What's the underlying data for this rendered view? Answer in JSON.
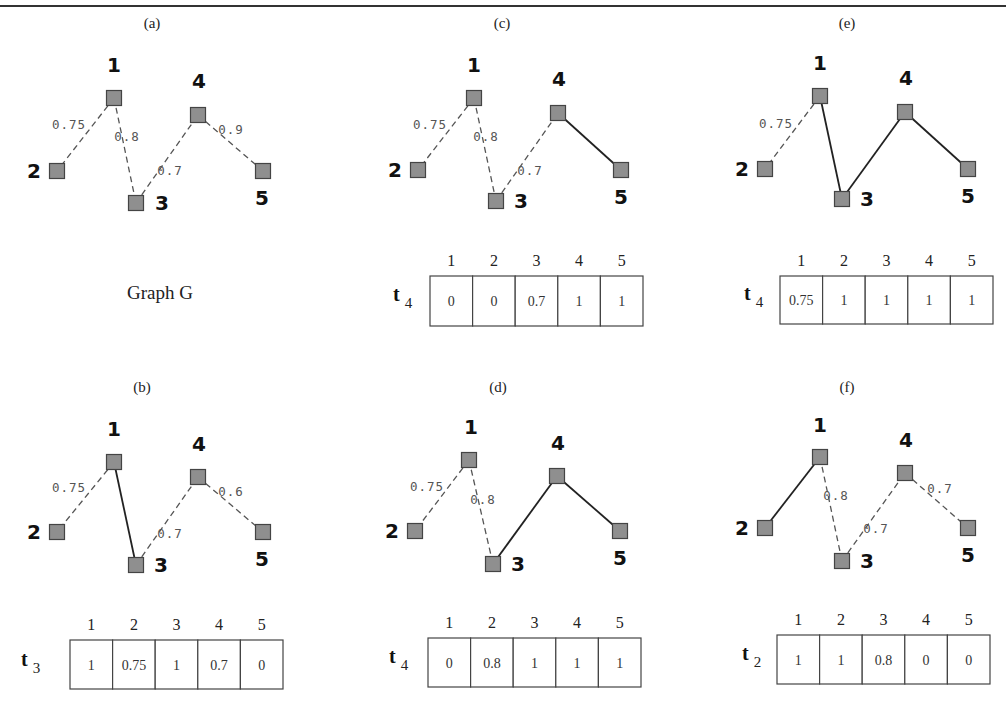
{
  "figure": {
    "colors": {
      "node_fill": "#8f8f8f",
      "node_stroke": "#444444",
      "solid_edge": "#222222",
      "dashed_edge": "#555555",
      "weight_text": "#555555",
      "table_border": "#444444"
    },
    "graph_caption": {
      "text": "Graph G",
      "x": 160,
      "y": 299
    },
    "panels": [
      {
        "id": "a",
        "caption": "(a)",
        "caption_pos": [
          152,
          28
        ],
        "nodes": [
          {
            "id": "1",
            "x": 114,
            "y": 98,
            "label_pos": [
              114,
              72
            ]
          },
          {
            "id": "2",
            "x": 57,
            "y": 171,
            "label_pos": [
              34,
              178
            ]
          },
          {
            "id": "3",
            "x": 136,
            "y": 203,
            "label_pos": [
              162,
              210
            ]
          },
          {
            "id": "4",
            "x": 198,
            "y": 115,
            "label_pos": [
              199,
              88
            ]
          },
          {
            "id": "5",
            "x": 263,
            "y": 171,
            "label_pos": [
              262,
              205
            ]
          }
        ],
        "edges": [
          {
            "from": "1",
            "to": "2",
            "style": "dashed",
            "weight": "0.75",
            "weight_pos": [
              69,
              129
            ]
          },
          {
            "from": "1",
            "to": "3",
            "style": "dashed",
            "weight": "0.8",
            "weight_pos": [
              127,
              141
            ]
          },
          {
            "from": "3",
            "to": "4",
            "style": "dashed",
            "weight": "0.7",
            "weight_pos": [
              170,
              175
            ]
          },
          {
            "from": "4",
            "to": "5",
            "style": "dashed",
            "weight": "0.9",
            "weight_pos": [
              231,
              134
            ]
          }
        ],
        "table": null
      },
      {
        "id": "c",
        "caption": "(c)",
        "caption_pos": [
          502,
          28
        ],
        "nodes": [
          {
            "id": "1",
            "x": 474,
            "y": 98,
            "label_pos": [
              474,
              72
            ]
          },
          {
            "id": "2",
            "x": 418,
            "y": 170,
            "label_pos": [
              395,
              177
            ]
          },
          {
            "id": "3",
            "x": 496,
            "y": 201,
            "label_pos": [
              521,
              208
            ]
          },
          {
            "id": "4",
            "x": 558,
            "y": 113,
            "label_pos": [
              559,
              86
            ]
          },
          {
            "id": "5",
            "x": 621,
            "y": 170,
            "label_pos": [
              621,
              204
            ]
          }
        ],
        "edges": [
          {
            "from": "1",
            "to": "2",
            "style": "dashed",
            "weight": "0.75",
            "weight_pos": [
              430,
              129
            ]
          },
          {
            "from": "1",
            "to": "3",
            "style": "dashed",
            "weight": "0.8",
            "weight_pos": [
              486,
              141
            ]
          },
          {
            "from": "3",
            "to": "4",
            "style": "dashed",
            "weight": "0.7",
            "weight_pos": [
              530,
              175
            ]
          },
          {
            "from": "4",
            "to": "5",
            "style": "solid",
            "weight": "",
            "weight_pos": null
          }
        ],
        "table": {
          "x": 430,
          "y": 276,
          "cell_w": 42.6,
          "cell_h": 50,
          "row_label": "t",
          "row_sub": "4",
          "row_label_pos": [
            393,
            301
          ],
          "headers": [
            "1",
            "2",
            "3",
            "4",
            "5"
          ],
          "values": [
            "0",
            "0",
            "0.7",
            "1",
            "1"
          ]
        }
      },
      {
        "id": "e",
        "caption": "(e)",
        "caption_pos": [
          847,
          28
        ],
        "nodes": [
          {
            "id": "1",
            "x": 820,
            "y": 96,
            "label_pos": [
              820,
              70
            ]
          },
          {
            "id": "2",
            "x": 765,
            "y": 169,
            "label_pos": [
              742,
              176
            ]
          },
          {
            "id": "3",
            "x": 842,
            "y": 199,
            "label_pos": [
              867,
              206
            ]
          },
          {
            "id": "4",
            "x": 905,
            "y": 112,
            "label_pos": [
              906,
              85
            ]
          },
          {
            "id": "5",
            "x": 968,
            "y": 169,
            "label_pos": [
              968,
              203
            ]
          }
        ],
        "edges": [
          {
            "from": "1",
            "to": "2",
            "style": "dashed",
            "weight": "0.75",
            "weight_pos": [
              776,
              128
            ]
          },
          {
            "from": "1",
            "to": "3",
            "style": "solid",
            "weight": "",
            "weight_pos": null
          },
          {
            "from": "3",
            "to": "4",
            "style": "solid",
            "weight": "",
            "weight_pos": null
          },
          {
            "from": "4",
            "to": "5",
            "style": "solid",
            "weight": "",
            "weight_pos": null
          }
        ],
        "table": {
          "x": 780,
          "y": 276,
          "cell_w": 42.6,
          "cell_h": 48,
          "row_label": "t",
          "row_sub": "4",
          "row_label_pos": [
            744,
            300
          ],
          "headers": [
            "1",
            "2",
            "3",
            "4",
            "5"
          ],
          "values": [
            "0.75",
            "1",
            "1",
            "1",
            "1"
          ]
        }
      },
      {
        "id": "b",
        "caption": "(b)",
        "caption_pos": [
          142,
          392
        ],
        "nodes": [
          {
            "id": "1",
            "x": 114,
            "y": 462,
            "label_pos": [
              114,
              436
            ]
          },
          {
            "id": "2",
            "x": 57,
            "y": 532,
            "label_pos": [
              34,
              539
            ]
          },
          {
            "id": "3",
            "x": 136,
            "y": 565,
            "label_pos": [
              161,
              572
            ]
          },
          {
            "id": "4",
            "x": 198,
            "y": 477,
            "label_pos": [
              199,
              451
            ]
          },
          {
            "id": "5",
            "x": 263,
            "y": 532,
            "label_pos": [
              262,
              566
            ]
          }
        ],
        "edges": [
          {
            "from": "1",
            "to": "2",
            "style": "dashed",
            "weight": "0.75",
            "weight_pos": [
              69,
              492
            ]
          },
          {
            "from": "1",
            "to": "3",
            "style": "solid",
            "weight": "",
            "weight_pos": null
          },
          {
            "from": "3",
            "to": "4",
            "style": "dashed",
            "weight": "0.7",
            "weight_pos": [
              170,
              538
            ]
          },
          {
            "from": "4",
            "to": "5",
            "style": "dashed",
            "weight": "0.6",
            "weight_pos": [
              231,
              496
            ]
          }
        ],
        "table": {
          "x": 70,
          "y": 640,
          "cell_w": 42.6,
          "cell_h": 49,
          "row_label": "t",
          "row_sub": "3",
          "row_label_pos": [
            21,
            666
          ],
          "headers": [
            "1",
            "2",
            "3",
            "4",
            "5"
          ],
          "values": [
            "1",
            "0.75",
            "1",
            "0.7",
            "0"
          ]
        }
      },
      {
        "id": "d",
        "caption": "(d)",
        "caption_pos": [
          498,
          392
        ],
        "nodes": [
          {
            "id": "1",
            "x": 469,
            "y": 460,
            "label_pos": [
              471,
              434
            ]
          },
          {
            "id": "2",
            "x": 415,
            "y": 531,
            "label_pos": [
              392,
              538
            ]
          },
          {
            "id": "3",
            "x": 493,
            "y": 564,
            "label_pos": [
              518,
              571
            ]
          },
          {
            "id": "4",
            "x": 557,
            "y": 476,
            "label_pos": [
              558,
              450
            ]
          },
          {
            "id": "5",
            "x": 620,
            "y": 531,
            "label_pos": [
              620,
              565
            ]
          }
        ],
        "edges": [
          {
            "from": "1",
            "to": "2",
            "style": "dashed",
            "weight": "0.75",
            "weight_pos": [
              427,
              491
            ]
          },
          {
            "from": "1",
            "to": "3",
            "style": "dashed",
            "weight": "0.8",
            "weight_pos": [
              483,
              504
            ]
          },
          {
            "from": "3",
            "to": "4",
            "style": "solid",
            "weight": "",
            "weight_pos": null
          },
          {
            "from": "4",
            "to": "5",
            "style": "solid",
            "weight": "",
            "weight_pos": null
          }
        ],
        "table": {
          "x": 428,
          "y": 638,
          "cell_w": 42.6,
          "cell_h": 49,
          "row_label": "t",
          "row_sub": "4",
          "row_label_pos": [
            389,
            663
          ],
          "headers": [
            "1",
            "2",
            "3",
            "4",
            "5"
          ],
          "values": [
            "0",
            "0.8",
            "1",
            "1",
            "1"
          ]
        }
      },
      {
        "id": "f",
        "caption": "(f)",
        "caption_pos": [
          847,
          392
        ],
        "nodes": [
          {
            "id": "1",
            "x": 820,
            "y": 457,
            "label_pos": [
              820,
              432
            ]
          },
          {
            "id": "2",
            "x": 765,
            "y": 528,
            "label_pos": [
              742,
              535
            ]
          },
          {
            "id": "3",
            "x": 842,
            "y": 561,
            "label_pos": [
              867,
              568
            ]
          },
          {
            "id": "4",
            "x": 905,
            "y": 473,
            "label_pos": [
              906,
              447
            ]
          },
          {
            "id": "5",
            "x": 968,
            "y": 528,
            "label_pos": [
              968,
              562
            ]
          }
        ],
        "edges": [
          {
            "from": "1",
            "to": "2",
            "style": "solid",
            "weight": "",
            "weight_pos": null
          },
          {
            "from": "1",
            "to": "3",
            "style": "dashed",
            "weight": "0.8",
            "weight_pos": [
              836,
              500
            ]
          },
          {
            "from": "3",
            "to": "4",
            "style": "dashed",
            "weight": "0.7",
            "weight_pos": [
              876,
              533
            ]
          },
          {
            "from": "4",
            "to": "5",
            "style": "dashed",
            "weight": "0.7",
            "weight_pos": [
              940,
              493
            ]
          }
        ],
        "table": {
          "x": 777,
          "y": 635,
          "cell_w": 42.6,
          "cell_h": 49,
          "row_label": "t",
          "row_sub": "2",
          "row_label_pos": [
            742,
            660
          ],
          "headers": [
            "1",
            "2",
            "3",
            "4",
            "5"
          ],
          "values": [
            "1",
            "1",
            "0.8",
            "0",
            "0"
          ]
        }
      }
    ]
  }
}
